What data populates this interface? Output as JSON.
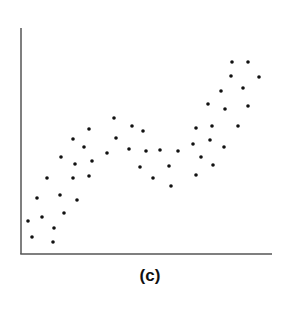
{
  "caption": "(c)",
  "colors": {
    "axis": "#555555",
    "point": "#111111",
    "background": "#ffffff"
  },
  "chart_data": {
    "type": "scatter",
    "title": "",
    "caption": "(c)",
    "xlabel": "",
    "ylabel": "",
    "grid": false,
    "legend": null,
    "axes": {
      "ticks": false,
      "x_pixel_range": [
        21,
        270
      ],
      "y_pixel_range": [
        28,
        254
      ]
    },
    "points_px": [
      [
        28,
        221
      ],
      [
        32,
        237
      ],
      [
        37,
        198
      ],
      [
        42,
        217
      ],
      [
        47,
        178
      ],
      [
        53,
        242
      ],
      [
        54,
        228
      ],
      [
        60,
        195
      ],
      [
        61,
        157
      ],
      [
        64,
        213
      ],
      [
        73,
        139
      ],
      [
        73,
        178
      ],
      [
        75,
        164
      ],
      [
        77,
        200
      ],
      [
        84,
        147
      ],
      [
        89,
        129
      ],
      [
        89,
        176
      ],
      [
        92,
        161
      ],
      [
        107,
        153
      ],
      [
        114,
        118
      ],
      [
        116,
        138
      ],
      [
        129,
        149
      ],
      [
        132,
        126
      ],
      [
        140,
        167
      ],
      [
        143,
        131
      ],
      [
        146,
        151
      ],
      [
        153,
        178
      ],
      [
        160,
        150
      ],
      [
        169,
        166
      ],
      [
        171,
        186
      ],
      [
        178,
        151
      ],
      [
        193,
        144
      ],
      [
        196,
        128
      ],
      [
        196,
        175
      ],
      [
        201,
        157
      ],
      [
        208,
        104
      ],
      [
        210,
        140
      ],
      [
        212,
        126
      ],
      [
        213,
        165
      ],
      [
        221,
        91
      ],
      [
        224,
        147
      ],
      [
        225,
        109
      ],
      [
        231,
        76
      ],
      [
        232,
        62
      ],
      [
        238,
        126
      ],
      [
        243,
        88
      ],
      [
        248,
        62
      ],
      [
        248,
        106
      ],
      [
        259,
        77
      ]
    ]
  }
}
